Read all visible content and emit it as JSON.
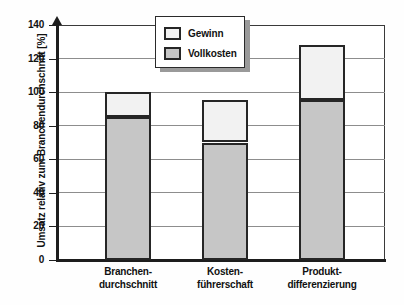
{
  "chart_data": {
    "type": "bar",
    "subtype": "stacked-bar",
    "title": "",
    "xlabel": "",
    "ylabel": "Umsatz relativ zum Branchendurchschnitt [%]",
    "ylim": [
      0,
      140
    ],
    "ytick_step": 20,
    "yticks": [
      140,
      120,
      100,
      80,
      60,
      40,
      20,
      0
    ],
    "ytick_labels": [
      "140",
      "120",
      "100",
      "80",
      "60",
      "40",
      "20",
      "0"
    ],
    "grid": true,
    "grid_axis": "y",
    "legend_position": "top-center",
    "categories": [
      "Branchen-durchschnitt",
      "Kosten-führerschaft",
      "Produkt-differenzierung"
    ],
    "category_label_lines": [
      [
        "Branchen-",
        "durchschnitt"
      ],
      [
        "Kosten-",
        "führerschaft"
      ],
      [
        "Produkt-",
        "differenzierung"
      ]
    ],
    "series": [
      {
        "name": "Vollkosten",
        "color": "#c6c6c6",
        "values": [
          85,
          70,
          95.5
        ]
      },
      {
        "name": "Gewinn",
        "color": "#f2f2f2",
        "values": [
          15,
          25.5,
          32.5
        ]
      }
    ],
    "totals": [
      100,
      95.5,
      128
    ],
    "legend": [
      {
        "label": "Gewinn",
        "color": "#f2f2f2"
      },
      {
        "label": "Vollkosten",
        "color": "#c6c6c6"
      }
    ]
  },
  "colors": {
    "gewinn": "#f2f2f2",
    "vollkosten": "#c6c6c6",
    "bar_border": "#262626",
    "axis": "#1d1d1d",
    "gridline": "#8d8d8d",
    "text": "#111111",
    "legend_shadow": "#9a9a9a",
    "background": "#ffffff"
  }
}
